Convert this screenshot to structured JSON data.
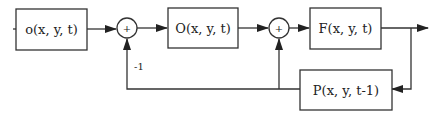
{
  "diagram": {
    "type": "block-diagram",
    "blocks": [
      {
        "id": "o",
        "label": "o(x, y, t)"
      },
      {
        "id": "O",
        "label": "O(x, y, t)"
      },
      {
        "id": "F",
        "label": "F(x, y, t)"
      },
      {
        "id": "P",
        "label": "P(x, y, t-1)"
      }
    ],
    "summers": [
      {
        "id": "sum1",
        "symbol": "+"
      },
      {
        "id": "sum2",
        "symbol": "+"
      }
    ],
    "gain_label": "-1",
    "colors": {
      "stroke": "#333333",
      "text": "#222222",
      "background": "#ffffff"
    }
  }
}
